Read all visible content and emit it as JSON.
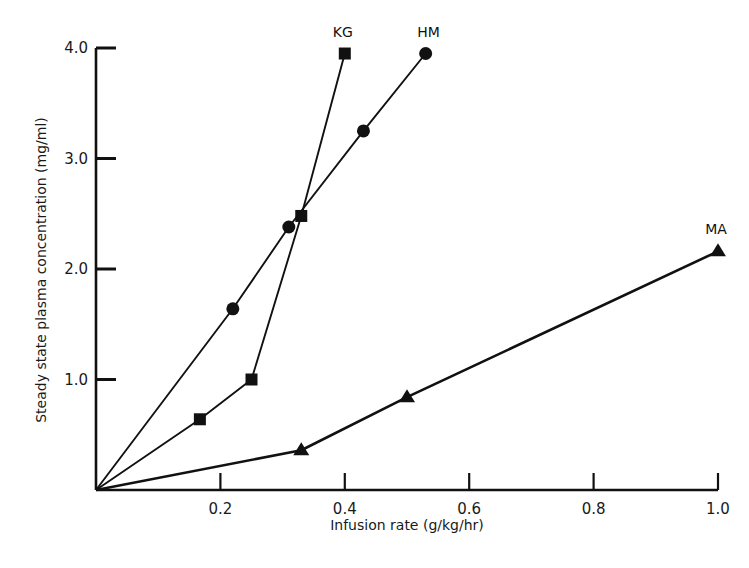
{
  "chart_data": {
    "type": "line",
    "title": "",
    "xlabel": "Infusion rate (g/kg/hr)",
    "ylabel": "Steady state plasma concentration  (mg/ml)",
    "xlim": [
      0,
      1.0
    ],
    "ylim": [
      0,
      4.0
    ],
    "grid": false,
    "legend": "direct labels at line ends",
    "x_ticks": [
      0.2,
      0.4,
      0.6,
      0.8,
      1.0
    ],
    "x_tick_labels": [
      "0.2",
      "0.4",
      "0.6",
      "0.8",
      "1.0"
    ],
    "y_ticks": [
      1.0,
      2.0,
      3.0,
      4.0
    ],
    "y_tick_labels": [
      "1.0",
      "2.0",
      "3.0",
      "4.0"
    ],
    "series": [
      {
        "name": "KG",
        "marker": "square",
        "x": [
          0,
          0.167,
          0.25,
          0.33,
          0.4
        ],
        "y": [
          0,
          0.64,
          1.0,
          2.48,
          3.95
        ]
      },
      {
        "name": "HM",
        "marker": "circle",
        "x": [
          0,
          0.22,
          0.31,
          0.43,
          0.53
        ],
        "y": [
          0,
          1.64,
          2.38,
          3.25,
          3.95
        ]
      },
      {
        "name": "MA",
        "marker": "triangle",
        "x": [
          0,
          0.33,
          0.5,
          1.0
        ],
        "y": [
          0,
          0.36,
          0.84,
          2.16
        ]
      }
    ]
  },
  "colors": {
    "ink": "#111111",
    "background": "#ffffff"
  }
}
